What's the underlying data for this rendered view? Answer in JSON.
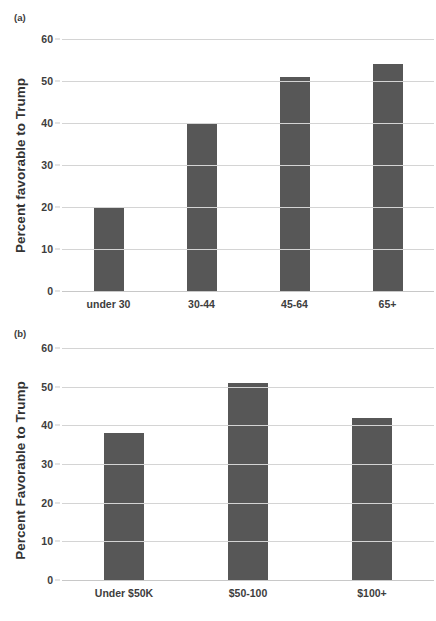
{
  "chart_data": [
    {
      "type": "bar",
      "panel_label": "(a)",
      "title": "",
      "xlabel": "",
      "ylabel": "Percent favorable to Trump",
      "categories": [
        "under 30",
        "30-44",
        "45-64",
        "65+"
      ],
      "values": [
        20,
        40,
        51,
        54
      ],
      "ylim": [
        0,
        60
      ],
      "yticks": [
        0,
        10,
        20,
        30,
        40,
        50,
        60
      ],
      "ytick_labels": [
        "0",
        "10",
        "20",
        "30",
        "40",
        "50",
        "60"
      ],
      "grid": true,
      "legend": "none",
      "bar_color": "#575757",
      "gridline_color": "#d4d4d4"
    },
    {
      "type": "bar",
      "panel_label": "(b)",
      "title": "",
      "xlabel": "",
      "ylabel": "Percent Favorable to Trump",
      "categories": [
        "Under $50K",
        "$50-100",
        "$100+"
      ],
      "values": [
        38,
        51,
        42
      ],
      "ylim": [
        0,
        60
      ],
      "yticks": [
        0,
        10,
        20,
        30,
        40,
        50,
        60
      ],
      "ytick_labels": [
        "0",
        "10",
        "20",
        "30",
        "40",
        "50",
        "60"
      ],
      "grid": true,
      "legend": "none",
      "bar_color": "#575757",
      "gridline_color": "#d4d4d4"
    }
  ]
}
